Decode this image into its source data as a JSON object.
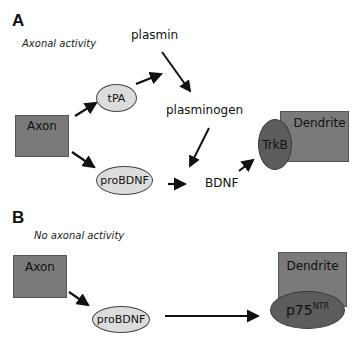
{
  "panel_a": {
    "letter": "A",
    "caption": "Axonal activity",
    "nodes": {
      "axon": "Axon",
      "tpa": "tPA",
      "plasmin": "plasmin",
      "plasminogen": "plasminogen",
      "probdnf": "proBDNF",
      "bdnf": "BDNF",
      "dendrite": "Dendrite",
      "receptor": "TrkB"
    },
    "edges": [
      {
        "from": "Axon",
        "to": "tPA"
      },
      {
        "from": "tPA",
        "to": "plasmin"
      },
      {
        "from": "plasmin",
        "to": "plasminogen"
      },
      {
        "from": "plasminogen",
        "to": "BDNF"
      },
      {
        "from": "Axon",
        "to": "proBDNF"
      },
      {
        "from": "proBDNF",
        "to": "BDNF"
      },
      {
        "from": "BDNF",
        "to": "TrkB"
      }
    ]
  },
  "panel_b": {
    "letter": "B",
    "caption": "No axonal activity",
    "nodes": {
      "axon": "Axon",
      "probdnf": "proBDNF",
      "dendrite": "Dendrite",
      "receptor_base": "p75",
      "receptor_sup": "NTR"
    },
    "edges": [
      {
        "from": "Axon",
        "to": "proBDNF"
      },
      {
        "from": "proBDNF",
        "to": "p75NTR"
      }
    ]
  },
  "colors": {
    "box_fill": "#7a7a7a",
    "ellipse_light": "#dcdcdc",
    "ellipse_dark": "#5c5c5c",
    "arrow": "#111111"
  }
}
